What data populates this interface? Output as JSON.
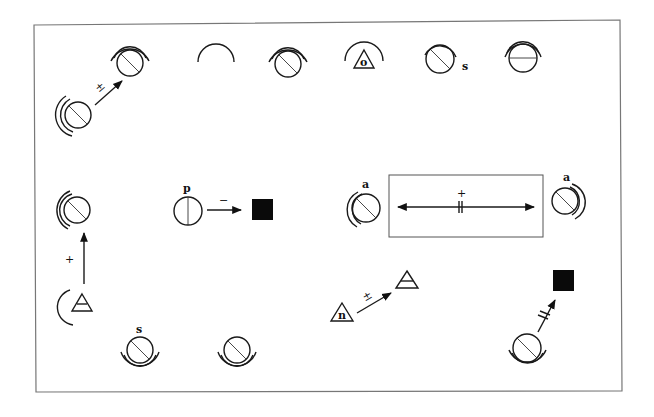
{
  "diagram": {
    "type": "symbol-relation-diagram",
    "frame": {
      "present": true
    },
    "symbols": [
      {
        "id": "s1",
        "kind": "circle-diagonal-double-arc",
        "x": 78,
        "y": 115,
        "arc_side": "left",
        "label": ""
      },
      {
        "id": "s2",
        "kind": "circle-diagonal-double-arc",
        "x": 130,
        "y": 62,
        "arc_side": "top",
        "label": ""
      },
      {
        "id": "s3",
        "kind": "arc-only",
        "x": 216,
        "y": 62,
        "label": ""
      },
      {
        "id": "s4",
        "kind": "circle-diagonal-double-arc",
        "x": 288,
        "y": 62,
        "arc_side": "top",
        "label": ""
      },
      {
        "id": "s5",
        "kind": "triangle-in-arc",
        "x": 363,
        "y": 58,
        "label": "o"
      },
      {
        "id": "s6",
        "kind": "circle-diagonal-single-arc",
        "x": 443,
        "y": 58,
        "arc_side": "top",
        "label": "s"
      },
      {
        "id": "s7",
        "kind": "circle-horizontal-double-arc",
        "x": 523,
        "y": 58,
        "arc_side": "top",
        "label": ""
      },
      {
        "id": "s8",
        "kind": "circle-diagonal-double-arc",
        "x": 77,
        "y": 211,
        "arc_side": "left",
        "label": ""
      },
      {
        "id": "s9",
        "kind": "circle-vertical",
        "x": 188,
        "y": 211,
        "label": "p"
      },
      {
        "id": "s10",
        "kind": "filled-square",
        "x": 262,
        "y": 210,
        "label": ""
      },
      {
        "id": "s11",
        "kind": "triangle-bar-in-arc",
        "x": 80,
        "y": 305,
        "arc_side": "left",
        "label": ""
      },
      {
        "id": "s12",
        "kind": "circle-diagonal-double-arc",
        "x": 140,
        "y": 353,
        "arc_side": "bottom",
        "label": "s"
      },
      {
        "id": "s13",
        "kind": "circle-diagonal-double-arc",
        "x": 237,
        "y": 353,
        "arc_side": "bottom",
        "label": ""
      },
      {
        "id": "s14",
        "kind": "circle-diagonal-double-arc",
        "x": 364,
        "y": 210,
        "arc_side": "left",
        "label": "a"
      },
      {
        "id": "s15",
        "kind": "circle-diagonal-double-arc",
        "x": 565,
        "y": 201,
        "arc_side": "right",
        "label": "a"
      },
      {
        "id": "s16",
        "kind": "triangle-letter",
        "x": 342,
        "y": 313,
        "label": "n"
      },
      {
        "id": "s17",
        "kind": "triangle-bar",
        "x": 407,
        "y": 281,
        "label": ""
      },
      {
        "id": "s18",
        "kind": "filled-square",
        "x": 563,
        "y": 281,
        "label": ""
      },
      {
        "id": "s19",
        "kind": "circle-diagonal-double-arc",
        "x": 527,
        "y": 348,
        "arc_side": "bottom",
        "label": ""
      }
    ],
    "relations": [
      {
        "from": "s1",
        "to": "s2",
        "sign": "±",
        "style": "arrow"
      },
      {
        "from": "s9",
        "to": "s10",
        "sign": "−",
        "style": "arrow"
      },
      {
        "from": "s11",
        "to": "s8",
        "sign": "+",
        "style": "arrow"
      },
      {
        "from": "s14",
        "to": "s15",
        "sign": "+",
        "style": "double-arrow-in-box",
        "marker": "||"
      },
      {
        "from": "s16",
        "to": "s17",
        "sign": "±",
        "style": "arrow"
      },
      {
        "from": "s19",
        "to": "s18",
        "sign": "",
        "style": "arrow",
        "marker": "//"
      }
    ]
  },
  "labels": {
    "o": "o",
    "s_top": "s",
    "p": "p",
    "s_bottom": "s",
    "a_left": "a",
    "a_right": "a",
    "n": "n",
    "sign_pm_1": "±",
    "sign_minus": "−",
    "sign_plus_1": "+",
    "sign_plus_box": "+",
    "sign_pm_2": "±"
  }
}
